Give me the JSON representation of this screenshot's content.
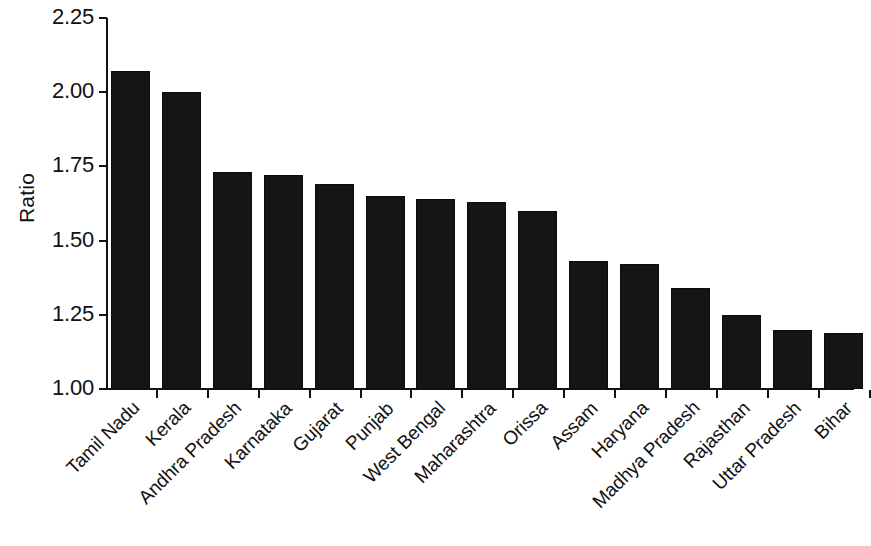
{
  "chart_data": {
    "type": "bar",
    "title": "",
    "xlabel": "",
    "ylabel": "Ratio",
    "ylim": [
      1.0,
      2.25
    ],
    "ytick_labels": [
      "2.25",
      "2.00",
      "1.75",
      "1.50",
      "1.25",
      "1.00"
    ],
    "ytick_values": [
      2.25,
      2.0,
      1.75,
      1.5,
      1.25,
      1.0
    ],
    "grid": false,
    "legend": "none",
    "bar_color": "#151515",
    "axis_color": "#111111",
    "background": "#ffffff",
    "categories": [
      "Tamil Nadu",
      "Kerala",
      "Andhra Pradesh",
      "Karnataka",
      "Gujarat",
      "Punjab",
      "West Bengal",
      "Maharashtra",
      "Orissa",
      "Assam",
      "Haryana",
      "Madhya Pradesh",
      "Rajasthan",
      "Uttar Pradesh",
      "Bihar"
    ],
    "values": [
      2.07,
      2.0,
      1.73,
      1.72,
      1.69,
      1.65,
      1.64,
      1.63,
      1.6,
      1.43,
      1.42,
      1.34,
      1.25,
      1.2,
      1.19
    ]
  }
}
